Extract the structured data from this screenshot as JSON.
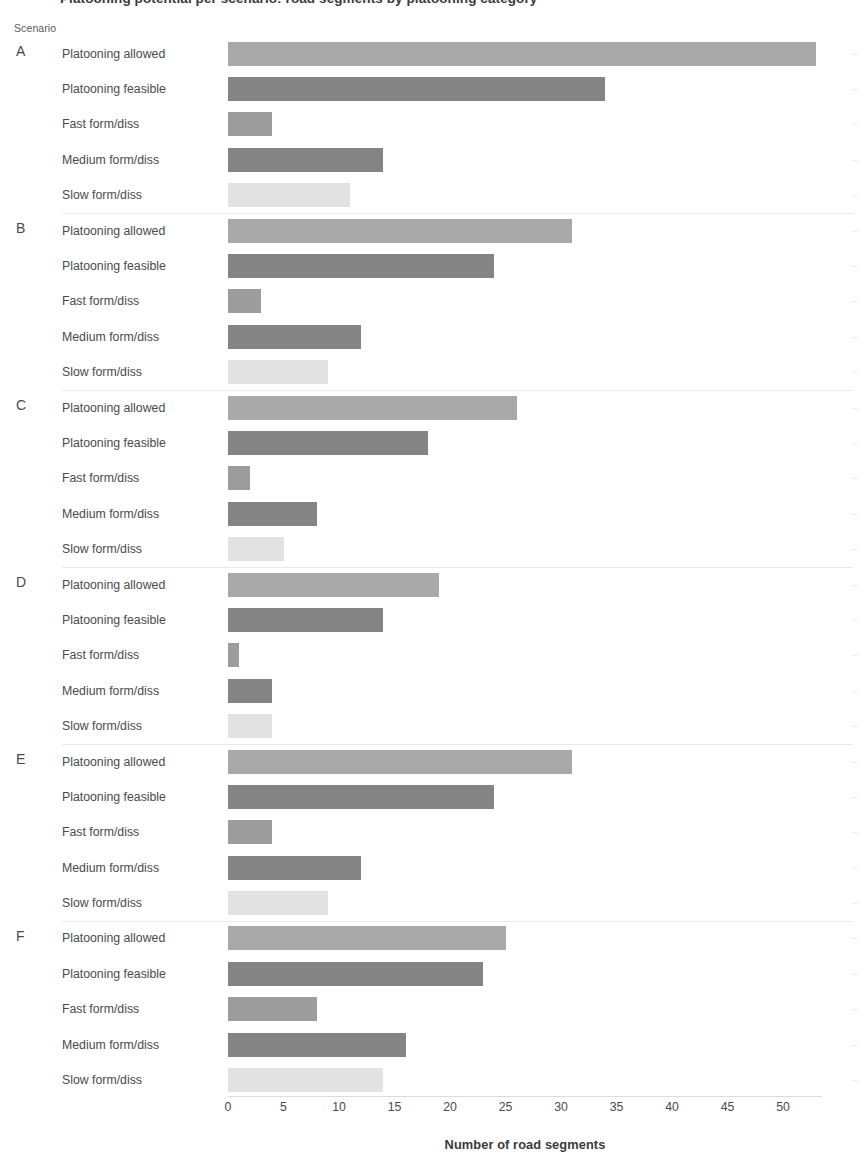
{
  "title_clipped": "Platooning potential per scenario: road segments by platooning category",
  "axis_group_header": "Scenario",
  "xaxis": {
    "label": "Number of road segments",
    "ticks": [
      0,
      5,
      10,
      15,
      20,
      25,
      30,
      35,
      40,
      45,
      50
    ],
    "min": 0,
    "max": 53.5
  },
  "category_labels": [
    "Platooning allowed",
    "Platooning feasible",
    "Fast form/diss",
    "Medium form/diss",
    "Slow form/diss"
  ],
  "colors": {
    "platooning_allowed": "#a9a9a9",
    "platooning_feasible": "#848484",
    "fast_form_diss": "#9d9d9d",
    "medium_form_diss": "#848484",
    "slow_form_diss": "#e2e2e2",
    "text": "#4b4b4b",
    "gridline": "#e9e9e9"
  },
  "chart_data": {
    "type": "bar",
    "orientation": "horizontal",
    "title": "Platooning potential per scenario: road segments by platooning category",
    "xlabel": "Number of road segments",
    "ylabel": "Scenario",
    "xlim": [
      0,
      53.5
    ],
    "grid": false,
    "legend": "none",
    "group_key": "Scenario",
    "groups": [
      "A",
      "B",
      "C",
      "D",
      "E",
      "F"
    ],
    "categories": [
      "Platooning allowed",
      "Platooning feasible",
      "Fast form/diss",
      "Medium form/diss",
      "Slow form/diss"
    ],
    "series": [
      {
        "name": "A",
        "values": [
          53,
          34,
          4,
          14,
          11
        ]
      },
      {
        "name": "B",
        "values": [
          31,
          24,
          3,
          12,
          9
        ]
      },
      {
        "name": "C",
        "values": [
          26,
          18,
          2,
          8,
          5
        ]
      },
      {
        "name": "D",
        "values": [
          19,
          14,
          1,
          4,
          4
        ]
      },
      {
        "name": "E",
        "values": [
          31,
          24,
          4,
          12,
          9
        ]
      },
      {
        "name": "F",
        "values": [
          25,
          23,
          8,
          16,
          14
        ]
      }
    ]
  }
}
